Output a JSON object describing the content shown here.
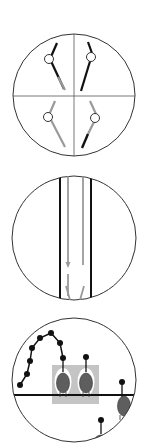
{
  "figure": {
    "colors": {
      "outline": "#333333",
      "black_line": "#111111",
      "grey_line": "#9a9a9a",
      "grey_box": "#c4c4c4",
      "oval_fill": "#5e5e5e",
      "white_halo": "#ffffff",
      "dot": "#111111"
    },
    "panels": [
      {
        "id": "panel-1",
        "type": "quadrant-circle",
        "center": [
          74,
          95
        ],
        "radius": 61,
        "quadrants": [
          "top-left",
          "top-right",
          "bottom-left",
          "bottom-right"
        ]
      },
      {
        "id": "panel-2",
        "type": "parallel-strands",
        "center": [
          74,
          238
        ],
        "radius": 62,
        "strands": [
          "black-left",
          "grey-arrow-down-left",
          "grey-arrow-down-right",
          "black-right"
        ]
      },
      {
        "id": "panel-3",
        "type": "bead-chain",
        "center": [
          74,
          380
        ],
        "radius": 62,
        "chain_dots": 9,
        "ovals": 4
      }
    ]
  }
}
